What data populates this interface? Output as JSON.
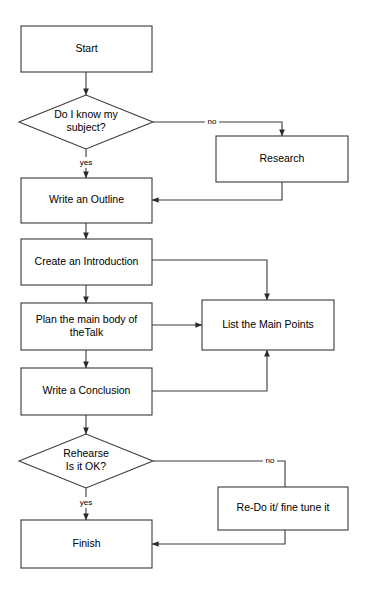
{
  "diagram": {
    "canvas": {
      "width": 366,
      "height": 593,
      "background": "#ffffff"
    },
    "style": {
      "stroke": "#3a3a3a",
      "fill": "#ffffff",
      "text_color": "#000000",
      "node_font_size": 10.5,
      "edge_font_size": 8
    },
    "nodes": [
      {
        "id": "start",
        "type": "process",
        "label": "Start",
        "x": 21,
        "y": 26,
        "w": 131,
        "h": 46,
        "lines": [
          "Start"
        ]
      },
      {
        "id": "know_subject",
        "type": "decision",
        "label": "Do I know my subject?",
        "cx": 86,
        "cy": 122,
        "rx": 67,
        "ry": 27,
        "lines": [
          "Do I know my",
          "subject?"
        ]
      },
      {
        "id": "research",
        "type": "process",
        "label": "Research",
        "x": 216,
        "y": 136,
        "w": 132,
        "h": 46,
        "lines": [
          "Research"
        ]
      },
      {
        "id": "write_outline",
        "type": "process",
        "label": "Write an Outline",
        "x": 21,
        "y": 178,
        "w": 131,
        "h": 45,
        "lines": [
          "Write an Outline"
        ]
      },
      {
        "id": "create_intro",
        "type": "process",
        "label": "Create an Introduction",
        "x": 21,
        "y": 239,
        "w": 131,
        "h": 46,
        "lines": [
          "Create an Introduction"
        ]
      },
      {
        "id": "plan_body",
        "type": "process",
        "label": "Plan the main body of theTalk",
        "x": 21,
        "y": 303,
        "w": 131,
        "h": 47,
        "lines": [
          "Plan the main body of",
          "theTalk"
        ]
      },
      {
        "id": "list_points",
        "type": "process",
        "label": "List the Main Points",
        "x": 202,
        "y": 300,
        "w": 132,
        "h": 50,
        "lines": [
          "List the Main Points"
        ]
      },
      {
        "id": "write_conclusion",
        "type": "process",
        "label": "Write a Conclusion",
        "x": 21,
        "y": 368,
        "w": 131,
        "h": 47,
        "lines": [
          "Write a Conclusion"
        ]
      },
      {
        "id": "rehearse",
        "type": "decision",
        "label": "Rehearse Is it OK?",
        "cx": 86,
        "cy": 461,
        "rx": 67,
        "ry": 27,
        "lines": [
          "Rehearse",
          "Is it OK?"
        ]
      },
      {
        "id": "redo",
        "type": "process",
        "label": "Re-Do it/ fine tune it",
        "x": 218,
        "y": 487,
        "w": 130,
        "h": 43,
        "lines": [
          "Re-Do it/ fine tune it"
        ]
      },
      {
        "id": "finish",
        "type": "process",
        "label": "Finish",
        "x": 21,
        "y": 520,
        "w": 131,
        "h": 48,
        "lines": [
          "Finish"
        ]
      }
    ],
    "edges": [
      {
        "id": "start-to-decision",
        "from": "start",
        "to": "know_subject",
        "label": "",
        "points": [
          [
            86,
            72
          ],
          [
            86,
            95
          ]
        ],
        "arrow": "end"
      },
      {
        "id": "decision-no-to-research",
        "from": "know_subject",
        "to": "research",
        "label": "no",
        "label_x": 212,
        "label_y": 122,
        "points": [
          [
            153,
            122
          ],
          [
            282,
            122
          ],
          [
            282,
            136
          ]
        ],
        "arrow": "end"
      },
      {
        "id": "decision-yes-to-outline",
        "from": "know_subject",
        "to": "write_outline",
        "label": "yes",
        "label_x": 86,
        "label_y": 163,
        "points": [
          [
            86,
            149
          ],
          [
            86,
            178
          ]
        ],
        "arrow": "end"
      },
      {
        "id": "research-to-outline",
        "from": "research",
        "to": "write_outline",
        "label": "",
        "points": [
          [
            282,
            182
          ],
          [
            282,
            200
          ],
          [
            152,
            200
          ]
        ],
        "arrow": "end"
      },
      {
        "id": "outline-to-intro",
        "from": "write_outline",
        "to": "create_intro",
        "label": "",
        "points": [
          [
            86,
            223
          ],
          [
            86,
            239
          ]
        ],
        "arrow": "end"
      },
      {
        "id": "intro-to-list",
        "from": "create_intro",
        "to": "list_points",
        "label": "",
        "points": [
          [
            152,
            260
          ],
          [
            267,
            260
          ],
          [
            267,
            300
          ]
        ],
        "arrow": "end"
      },
      {
        "id": "intro-to-plan",
        "from": "create_intro",
        "to": "plan_body",
        "label": "",
        "points": [
          [
            86,
            285
          ],
          [
            86,
            303
          ]
        ],
        "arrow": "end"
      },
      {
        "id": "plan-to-list",
        "from": "plan_body",
        "to": "list_points",
        "label": "",
        "points": [
          [
            152,
            325
          ],
          [
            202,
            325
          ]
        ],
        "arrow": "end"
      },
      {
        "id": "plan-to-conclusion",
        "from": "plan_body",
        "to": "write_conclusion",
        "label": "",
        "points": [
          [
            86,
            350
          ],
          [
            86,
            368
          ]
        ],
        "arrow": "end"
      },
      {
        "id": "conclusion-to-list",
        "from": "write_conclusion",
        "to": "list_points",
        "label": "",
        "points": [
          [
            152,
            391
          ],
          [
            267,
            391
          ],
          [
            267,
            350
          ]
        ],
        "arrow": "end"
      },
      {
        "id": "conclusion-to-rehearse",
        "from": "write_conclusion",
        "to": "rehearse",
        "label": "",
        "points": [
          [
            86,
            415
          ],
          [
            86,
            434
          ]
        ],
        "arrow": "end"
      },
      {
        "id": "rehearse-no-to-redo",
        "from": "rehearse",
        "to": "redo",
        "label": "no",
        "label_x": 270,
        "label_y": 461,
        "points": [
          [
            153,
            461
          ],
          [
            285,
            461
          ],
          [
            285,
            487
          ]
        ],
        "arrow": "none"
      },
      {
        "id": "rehearse-yes-to-finish",
        "from": "rehearse",
        "to": "finish",
        "label": "yes",
        "label_x": 86,
        "label_y": 503,
        "points": [
          [
            86,
            488
          ],
          [
            86,
            520
          ]
        ],
        "arrow": "end"
      },
      {
        "id": "redo-to-finish",
        "from": "redo",
        "to": "finish",
        "label": "",
        "points": [
          [
            285,
            530
          ],
          [
            285,
            544
          ],
          [
            152,
            544
          ]
        ],
        "arrow": "end"
      }
    ],
    "caption": ""
  }
}
